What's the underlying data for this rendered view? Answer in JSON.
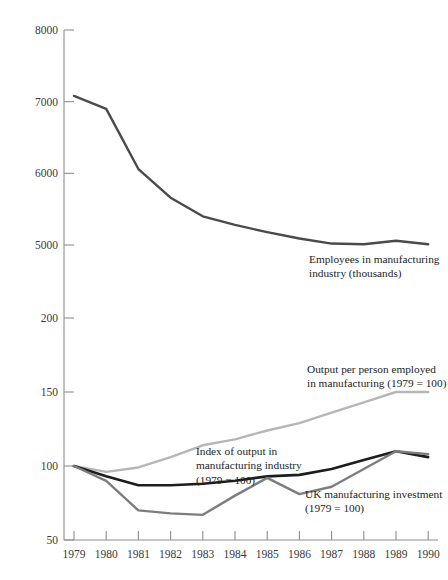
{
  "chart_data": {
    "type": "line",
    "title": "",
    "xlabel": "",
    "ylabel": "",
    "broken_axis": true,
    "grid": false,
    "legend_position": "inline-annotations",
    "x": [
      1979,
      1980,
      1981,
      1982,
      1983,
      1984,
      1985,
      1986,
      1987,
      1988,
      1989,
      1990
    ],
    "x_tick_labels": [
      "1979",
      "1980",
      "1981",
      "1982",
      "1983",
      "1984",
      "1985",
      "1986",
      "1987",
      "1988",
      "1989",
      "1990"
    ],
    "axes": [
      {
        "id": "upper",
        "ylim": [
          5000,
          8000
        ],
        "yticks": [
          5000,
          6000,
          7000,
          8000
        ],
        "ytick_labels": [
          "5000",
          "6000",
          "7000",
          "8000"
        ],
        "unit": "thousands"
      },
      {
        "id": "lower",
        "ylim": [
          50,
          200
        ],
        "yticks": [
          50,
          100,
          150,
          200
        ],
        "ytick_labels": [
          "50",
          "100",
          "150",
          "200"
        ],
        "unit": "index (1979 = 100)"
      }
    ],
    "series": [
      {
        "name": "Employees in manufacturing industry (thousands)",
        "axis": "upper",
        "color": "#4a4a4a",
        "width": 2.4,
        "values": [
          7080,
          6900,
          6060,
          5660,
          5400,
          5280,
          5180,
          5090,
          5020,
          5010,
          5060,
          5010
        ]
      },
      {
        "name": "Output per person employed in manufacturing (1979 = 100)",
        "axis": "lower",
        "color": "#b6b6b6",
        "width": 2.4,
        "values": [
          100,
          96,
          99,
          106,
          114,
          118,
          124,
          129,
          136,
          143,
          150,
          150
        ]
      },
      {
        "name": "Index of output in manufacturing industry (1979 = 100)",
        "axis": "lower",
        "color": "#1d1d1d",
        "width": 2.6,
        "values": [
          100,
          93,
          87,
          87,
          88,
          90,
          93,
          94,
          98,
          104,
          110,
          106
        ]
      },
      {
        "name": "UK manufacturing investment (1979 = 100)",
        "axis": "lower",
        "color": "#7d7d7d",
        "width": 2.4,
        "values": [
          100,
          90,
          70,
          68,
          67,
          80,
          92,
          81,
          86,
          98,
          110,
          108
        ]
      }
    ],
    "annotations": [
      {
        "id": "employees",
        "text": "Employees in manufacturing\n industry (thousands)"
      },
      {
        "id": "output_per_person",
        "text": "Output per person employed\nin manufacturing (1979 = 100)"
      },
      {
        "id": "index_of_output",
        "text": "Index of output in\nmanufacturing industry\n(1979 = 100)"
      },
      {
        "id": "uk_investment",
        "text": "UK manufacturing investment\n(1979 = 100)"
      }
    ],
    "colors": {
      "axis": "#8e8e8e",
      "text": "#232323",
      "employees": "#4a4a4a",
      "output_per_person": "#b6b6b6",
      "index_of_output": "#1d1d1d",
      "uk_investment": "#7d7d7d"
    }
  }
}
